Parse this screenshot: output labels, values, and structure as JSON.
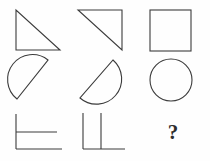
{
  "puzzle": {
    "title": "Shape Matrix Puzzle",
    "background_color": "#fefefe",
    "stroke_color": "#3b3b3b",
    "rows": 3,
    "columns": 3,
    "missing_cell_label": "?",
    "cells": [
      {
        "id": "r1c1",
        "row": 1,
        "column": 1,
        "shape": "right-triangle",
        "description": "Right triangle with right angle at bottom-left, hypotenuse from top-left to bottom-right",
        "points": "16,10 16,50 60,50"
      },
      {
        "id": "r1c2",
        "row": 1,
        "column": 2,
        "shape": "right-triangle",
        "description": "Right triangle with right angle at top-right, hypotenuse from top-left to bottom-right",
        "points": "8,10 52,10 52,50"
      },
      {
        "id": "r1c3",
        "row": 1,
        "column": 3,
        "shape": "square",
        "description": "Square outline",
        "x": 10,
        "y": 10,
        "width": 41,
        "height": 41
      },
      {
        "id": "r2c1",
        "row": 2,
        "column": 1,
        "shape": "semicircle",
        "description": "Half disk with straight chord from top-right to bottom-left, arc bulging up-left",
        "path": "M 48 5 A 22 22 0 1 0 17 44 Z"
      },
      {
        "id": "r2c2",
        "row": 2,
        "column": 2,
        "shape": "semicircle",
        "description": "Half disk with straight chord from top-right to bottom-left, arc bulging down-right",
        "path": "M 43 5 A 22 22 0 1 1 10 43 Z"
      },
      {
        "id": "r2c3",
        "row": 2,
        "column": 3,
        "shape": "circle",
        "description": "Full circle outline",
        "cx": 31,
        "cy": 25,
        "r": 21
      },
      {
        "id": "r3c1",
        "row": 3,
        "column": 1,
        "shape": "open-bracket-lines",
        "description": "Vertical line on left with two horizontal lines extending right",
        "path": "M 16 6 L 16 41 M 16 24 L 57 24 M 16 41 L 62 41"
      },
      {
        "id": "r3c2",
        "row": 3,
        "column": 2,
        "shape": "open-bracket-lines-rotated",
        "description": "Two vertical lines descending to a horizontal baseline extending right",
        "path": "M 13 5 L 13 41 M 31 5 L 31 41 M 13 41 L 55 41"
      },
      {
        "id": "r3c3",
        "row": 3,
        "column": 3,
        "shape": "question-mark",
        "description": "Missing element placeholder",
        "label": "?"
      }
    ]
  }
}
